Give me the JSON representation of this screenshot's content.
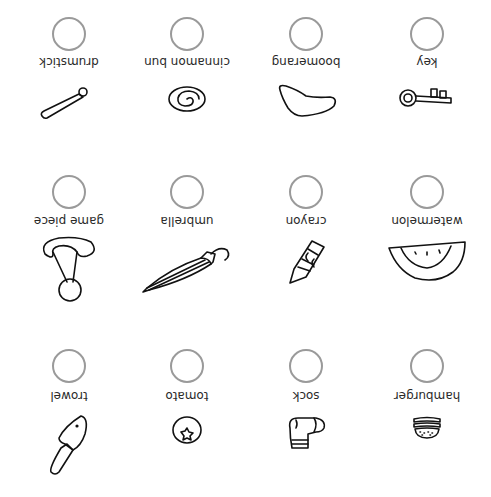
{
  "worksheet": {
    "orientation": "rotated 180 degrees",
    "items": [
      {
        "label": "drumstick",
        "icon": "drumstick-icon"
      },
      {
        "label": "cinnamon bun",
        "icon": "cinnamon-bun-icon"
      },
      {
        "label": "boomerang",
        "icon": "boomerang-icon"
      },
      {
        "label": "key",
        "icon": "key-icon"
      },
      {
        "label": "game piece",
        "icon": "game-piece-icon"
      },
      {
        "label": "umbrella",
        "icon": "umbrella-icon"
      },
      {
        "label": "crayon",
        "icon": "crayon-icon"
      },
      {
        "label": "watermelon",
        "icon": "watermelon-icon"
      },
      {
        "label": "trowel",
        "icon": "trowel-icon"
      },
      {
        "label": "tomato",
        "icon": "tomato-icon"
      },
      {
        "label": "sock",
        "icon": "sock-icon"
      },
      {
        "label": "hamburger",
        "icon": "hamburger-icon"
      }
    ],
    "colors": {
      "circle": "#9a9a9a",
      "text": "#2a2a2a",
      "line": "#111111"
    }
  }
}
